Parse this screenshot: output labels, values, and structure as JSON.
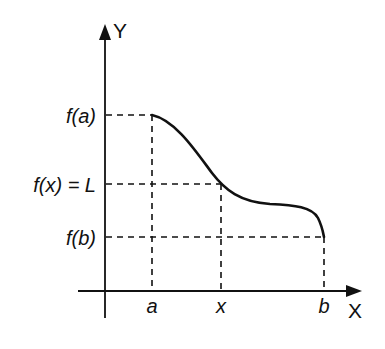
{
  "diagram": {
    "axes": {
      "x_label": "X",
      "y_label": "Y"
    },
    "x_ticks": [
      {
        "id": "a",
        "label": "a"
      },
      {
        "id": "x",
        "label": "x"
      },
      {
        "id": "b",
        "label": "b"
      }
    ],
    "y_ticks": [
      {
        "id": "fa",
        "label": "f(a)"
      },
      {
        "id": "fx",
        "label": "f(x) = L"
      },
      {
        "id": "fb",
        "label": "f(b)"
      }
    ],
    "curve": {
      "description": "decreasing curve from (a, f(a)) to (b, f(b)), passing through (x, L) with a plateau between x and b"
    },
    "colors": {
      "stroke": "#111111",
      "background": "#ffffff"
    }
  }
}
